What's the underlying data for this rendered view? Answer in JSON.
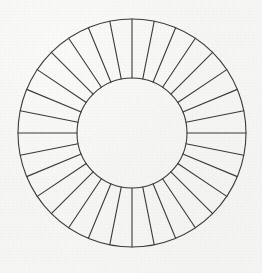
{
  "document": {
    "title": "Segmented Annulus Diagram",
    "background_color": "#f6f6f4",
    "medium": "scanned paper line drawing"
  },
  "figure": {
    "name": "segmented-annulus",
    "stroke_color": "#3a3a3a",
    "fill_color": "none",
    "stroke_width": 1.1,
    "inner_circle": {
      "name": "inner-circle",
      "center_x": 132,
      "center_y": 133,
      "radius": 55
    },
    "outer_circle": {
      "name": "outer-circle",
      "center_x": 132,
      "center_y": 133,
      "radius": 114
    },
    "spokes": {
      "name": "radial-spokes",
      "count": 32,
      "segment_count": 32,
      "angle_step_degrees": 11.25,
      "start_angle_degrees": 0,
      "aligned_axes": [
        0,
        90,
        180,
        270
      ],
      "angles_degrees": [
        0,
        11.25,
        22.5,
        33.75,
        45,
        56.25,
        67.5,
        78.75,
        90,
        101.25,
        112.5,
        123.75,
        135,
        146.25,
        157.5,
        168.75,
        180,
        191.25,
        202.5,
        213.75,
        225,
        236.25,
        247.5,
        258.75,
        270,
        281.25,
        292.5,
        303.75,
        315,
        326.25,
        337.5,
        348.75
      ]
    }
  },
  "chart_data": {
    "type": "pie",
    "title": "",
    "subtitle": "",
    "xlabel": "",
    "ylabel": "",
    "legend": [],
    "annotations": [],
    "grid": false,
    "donut": true,
    "inner_radius_ratio": 0.482,
    "categories": [
      "1",
      "2",
      "3",
      "4",
      "5",
      "6",
      "7",
      "8",
      "9",
      "10",
      "11",
      "12",
      "13",
      "14",
      "15",
      "16",
      "17",
      "18",
      "19",
      "20",
      "21",
      "22",
      "23",
      "24",
      "25",
      "26",
      "27",
      "28",
      "29",
      "30",
      "31",
      "32"
    ],
    "values": [
      3.125,
      3.125,
      3.125,
      3.125,
      3.125,
      3.125,
      3.125,
      3.125,
      3.125,
      3.125,
      3.125,
      3.125,
      3.125,
      3.125,
      3.125,
      3.125,
      3.125,
      3.125,
      3.125,
      3.125,
      3.125,
      3.125,
      3.125,
      3.125,
      3.125,
      3.125,
      3.125,
      3.125,
      3.125,
      3.125,
      3.125,
      3.125
    ],
    "value_unit": "percent",
    "slice_angle_degrees": 11.25,
    "colors": []
  }
}
